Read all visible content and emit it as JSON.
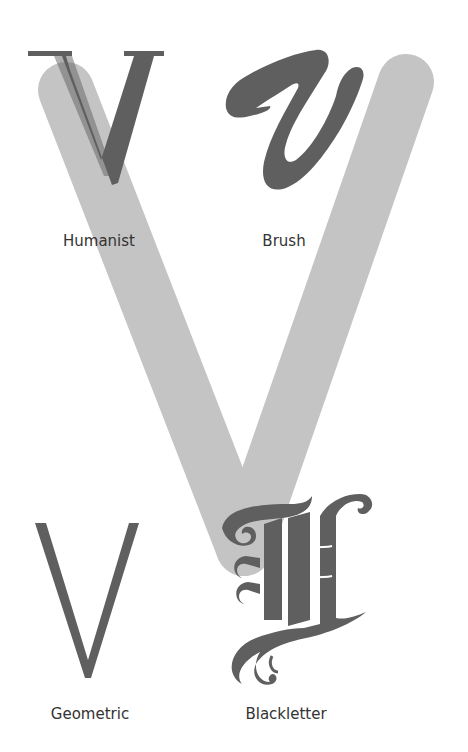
{
  "colors": {
    "background": "#ffffff",
    "big_v": "#c4c4c4",
    "glyph": "#5f5f5f",
    "label": "#333333"
  },
  "glyphs": [
    {
      "id": "humanist",
      "character": "V",
      "label": "Humanist"
    },
    {
      "id": "brush",
      "character": "v",
      "label": "Brush"
    },
    {
      "id": "geometric",
      "character": "V",
      "label": "Geometric"
    },
    {
      "id": "blackletter",
      "character": "V",
      "label": "Blackletter"
    }
  ]
}
